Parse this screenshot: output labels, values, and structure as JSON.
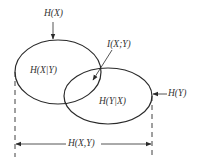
{
  "diagram": {
    "type": "venn-entropy",
    "labels": {
      "hx": "H(X)",
      "hy": "H(Y)",
      "hx_given_y": "H(X|Y)",
      "hy_given_x": "H(Y|X)",
      "mutual": "I(X;Y)",
      "joint": "H(X,Y)"
    },
    "colors": {
      "stroke": "#2a2a2a",
      "text": "#333333",
      "background": "#ffffff"
    }
  }
}
